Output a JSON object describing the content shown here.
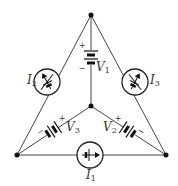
{
  "diagram": {
    "type": "circuit",
    "nodes": {
      "top": {
        "x": 91,
        "y": 15
      },
      "center": {
        "x": 91,
        "y": 106
      },
      "bottom_left": {
        "x": 17,
        "y": 155
      },
      "bottom_right": {
        "x": 166,
        "y": 155
      }
    },
    "components": {
      "V1": {
        "kind": "voltage-source",
        "symbol": "V",
        "subscript": "1",
        "plus": "+",
        "minus": "−",
        "between": [
          "top",
          "center"
        ]
      },
      "V2": {
        "kind": "voltage-source",
        "symbol": "V",
        "subscript": "2",
        "plus": "+",
        "minus": "−",
        "between": [
          "center",
          "bottom_right"
        ]
      },
      "V3": {
        "kind": "voltage-source",
        "symbol": "V",
        "subscript": "3",
        "plus": "+",
        "minus": "−",
        "between": [
          "bottom_left",
          "center"
        ]
      },
      "I1": {
        "kind": "current-source",
        "symbol": "I",
        "subscript": "1",
        "between": [
          "bottom_left",
          "bottom_right"
        ]
      },
      "I2": {
        "kind": "current-source",
        "symbol": "I",
        "subscript": "2",
        "between": [
          "top",
          "bottom_left"
        ]
      },
      "I3": {
        "kind": "current-source",
        "symbol": "I",
        "subscript": "3",
        "between": [
          "top",
          "bottom_right"
        ]
      }
    },
    "colors": {
      "line": "#444444",
      "ink": "#111111",
      "background": "#ffffff"
    }
  }
}
